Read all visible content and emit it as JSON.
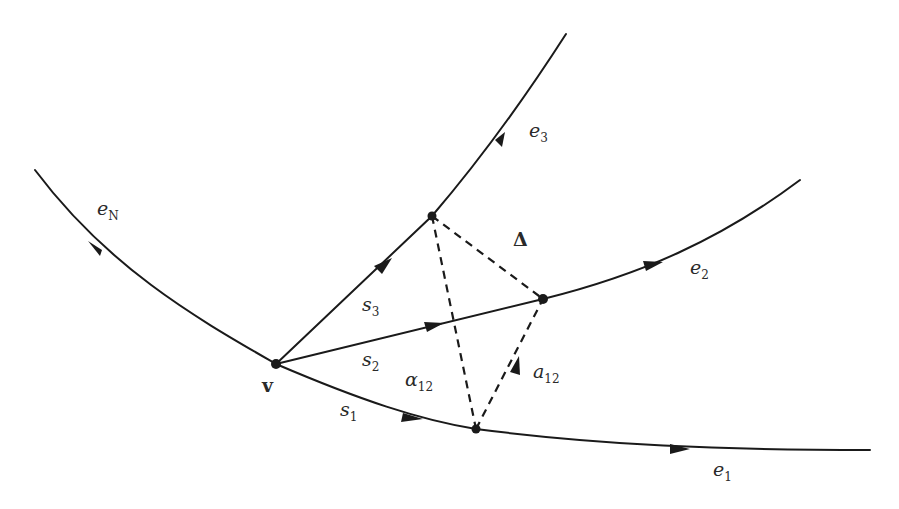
{
  "figure": {
    "background": "#ffffff",
    "stroke_color": "#1a1a1a",
    "vertex": {
      "label": "v",
      "x": 276,
      "y": 364
    },
    "nodes": [
      {
        "name": "node-e3",
        "x": 432,
        "y": 216
      },
      {
        "name": "node-e2",
        "x": 543,
        "y": 299
      },
      {
        "name": "node-e1",
        "x": 476,
        "y": 429
      }
    ],
    "edges": [
      {
        "name": "e1",
        "label": "e",
        "sub": "1"
      },
      {
        "name": "e2",
        "label": "e",
        "sub": "2"
      },
      {
        "name": "e3",
        "label": "e",
        "sub": "3"
      },
      {
        "name": "eN",
        "label": "e",
        "sub": "N"
      }
    ],
    "segments": [
      {
        "name": "s1",
        "label": "s",
        "sub": "1"
      },
      {
        "name": "s2",
        "label": "s",
        "sub": "2"
      },
      {
        "name": "s3",
        "label": "s",
        "sub": "3"
      }
    ],
    "triangle": {
      "label": "Δ"
    },
    "angle": {
      "label": "α",
      "sub": "12"
    },
    "vector": {
      "label": "a",
      "sub": "12"
    }
  }
}
